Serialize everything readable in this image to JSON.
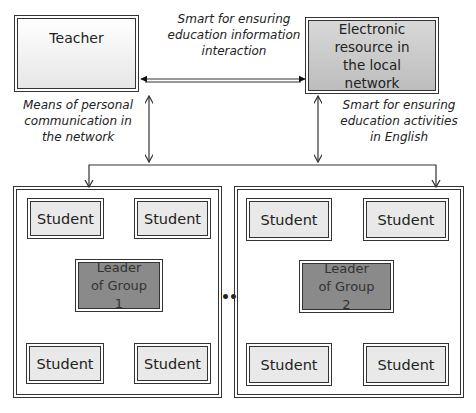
{
  "nodes": {
    "teacher": "Teacher",
    "electronic_resource": "Electronic resource in the local network",
    "group1": {
      "leader": "Leader of Group 1",
      "students": [
        "Student",
        "Student",
        "Student",
        "Student"
      ]
    },
    "group2": {
      "leader": "Leader of Group 2",
      "students": [
        "Student",
        "Student",
        "Student",
        "Student"
      ]
    }
  },
  "labels": {
    "top_connection": "Smart for ensuring education information interaction",
    "teacher_link": "Means of personal communication in the network",
    "resource_link": "Smart for ensuring education activities in English"
  },
  "ellipsis": "•••",
  "colors": {
    "student_fill": "#e9e9e9",
    "leader_fill": "#8a8a8a",
    "resource_fill": "#c8c8c8",
    "line": "#333333"
  }
}
